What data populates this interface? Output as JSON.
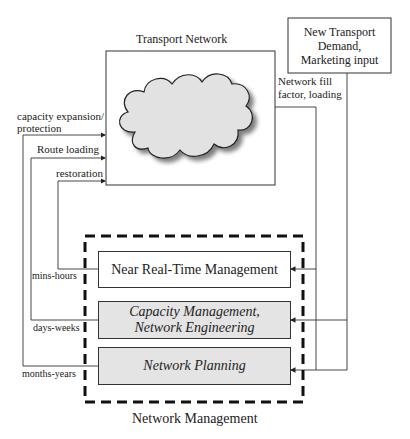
{
  "transport_network": {
    "title": "Transport Network",
    "icon": "cloud-icon"
  },
  "demand_box": {
    "line1": "New Transport",
    "line2": "Demand,",
    "line3": "Marketing input"
  },
  "feedback_labels": {
    "fill_line1": "Network fill",
    "fill_line2": "factor, loading"
  },
  "control_labels": {
    "capacity_line1": "capacity expansion/",
    "capacity_line2": "protection",
    "route_loading": "Route loading",
    "restoration": "restoration"
  },
  "timescale_labels": {
    "mins_hours": "mins-hours",
    "days_weeks": "days-weeks",
    "months_years": "months-years"
  },
  "management": {
    "group_title": "Network Management",
    "near_real_time": "Near Real-Time Management",
    "capacity_line1": "Capacity Management,",
    "capacity_line2": "Network Engineering",
    "planning": "Network Planning"
  },
  "colors": {
    "line": "#333333",
    "cloud_fill": "#e2e2e2",
    "shaded_box": "#e4e4e4"
  }
}
